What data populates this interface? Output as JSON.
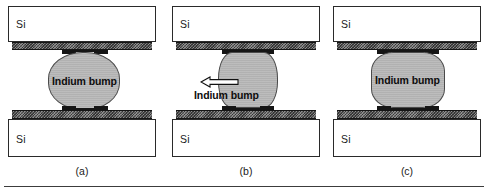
{
  "figure": {
    "panels": [
      {
        "id": "a",
        "caption": "(a)",
        "top_substrate_label": "Si",
        "bottom_substrate_label": "Si",
        "bump_label": "Indium bump",
        "bump_shape": "sphere",
        "stage": "before-bonding",
        "has_arrow": false
      },
      {
        "id": "b",
        "caption": "(b)",
        "top_substrate_label": "Si",
        "bottom_substrate_label": "Si",
        "bump_label": "Indium bump",
        "bump_shape": "elongated-column",
        "stage": "stretched",
        "has_arrow": true,
        "arrow_direction": "left",
        "arrow_name": "left-arrow-outline"
      },
      {
        "id": "c",
        "caption": "(c)",
        "top_substrate_label": "Si",
        "bottom_substrate_label": "Si",
        "bump_label": "Indium bump",
        "bump_shape": "compressed-barrel",
        "stage": "compressed",
        "has_arrow": false
      }
    ],
    "colors": {
      "substrate_fill": "#ffffff",
      "substrate_border": "#2a2a2a",
      "metal_layer": "#6f6f6f",
      "pad": "#151515",
      "bump_fill": "#b9b9b9",
      "bump_border": "#4a4a4a",
      "text": "#1a1a1a",
      "rule": "#3c3c3c"
    }
  }
}
